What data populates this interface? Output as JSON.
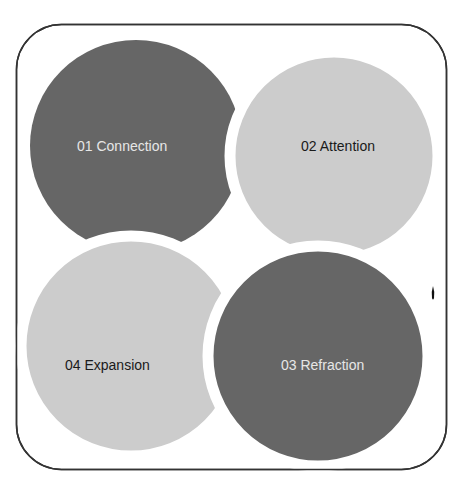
{
  "diagram": {
    "frame": {
      "stroke": "#333333",
      "fill": "#ffffff"
    },
    "gap_color": "#ffffff",
    "circles": [
      {
        "id": "01",
        "label": "01 Connection",
        "fill": "#666666",
        "text_color": "#e6e6e6"
      },
      {
        "id": "02",
        "label": "02 Attention",
        "fill": "#cccccc",
        "text_color": "#1a1a1a"
      },
      {
        "id": "03",
        "label": "03 Refraction",
        "fill": "#666666",
        "text_color": "#e6e6e6"
      },
      {
        "id": "04",
        "label": "04 Expansion",
        "fill": "#cccccc",
        "text_color": "#1a1a1a"
      }
    ]
  }
}
